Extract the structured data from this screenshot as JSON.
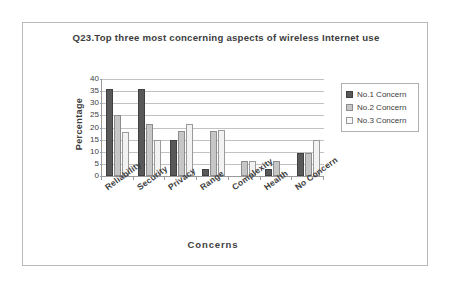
{
  "chart_data": {
    "type": "bar",
    "title": "Q23.Top three most concerning aspects of wireless Internet use",
    "xlabel": "Concerns",
    "ylabel": "Percentage",
    "ylim": [
      0,
      40
    ],
    "yticks": [
      0,
      5,
      10,
      15,
      20,
      25,
      30,
      35,
      40
    ],
    "grid": true,
    "legend_position": "right",
    "categories": [
      "Reliability",
      "Security",
      "Privacy",
      "Range",
      "Complexity",
      "Health",
      "No Concern"
    ],
    "series": [
      {
        "name": "No.1 Concern",
        "color": "#595959",
        "values": [
          36,
          36,
          15,
          3,
          0,
          3,
          9.5
        ]
      },
      {
        "name": "No.2 Concern",
        "color": "#c6c6c6",
        "values": [
          25,
          21.5,
          18.5,
          18.5,
          6,
          6,
          9.5
        ]
      },
      {
        "name": "No.3 Concern",
        "color": "#f2f2f2",
        "values": [
          18,
          15,
          21.5,
          19,
          6,
          0,
          15
        ]
      }
    ]
  }
}
